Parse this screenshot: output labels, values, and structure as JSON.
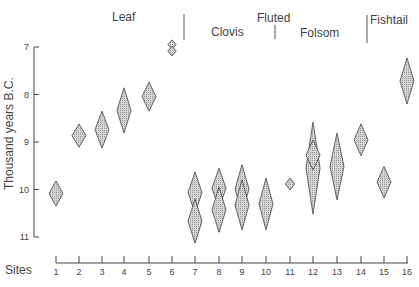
{
  "chart_data": {
    "type": "scatter",
    "subtype": "range-diamonds",
    "title": "",
    "xlabel": "Sites",
    "ylabel": "Thousand years B.C.",
    "ylim": [
      7,
      11
    ],
    "y_inverted": true,
    "y_ticks": [
      7,
      8,
      9,
      10,
      11
    ],
    "x_ticks": [
      1,
      2,
      3,
      4,
      5,
      6,
      7,
      8,
      9,
      10,
      11,
      12,
      13,
      14,
      15,
      16
    ],
    "grid": false,
    "groups": [
      {
        "name": "Leaf",
        "sites": [
          1,
          2,
          3,
          4,
          5,
          6
        ]
      },
      {
        "name": "Clovis",
        "sites": [
          7,
          8,
          9,
          10
        ]
      },
      {
        "name": "Fluted",
        "sites": []
      },
      {
        "name": "Folsom",
        "sites": [
          11,
          12,
          13,
          14
        ]
      },
      {
        "name": "Fishtail",
        "sites": [
          15,
          16
        ]
      }
    ],
    "points": [
      {
        "site": 1,
        "ranges": [
          [
            9.82,
            10.35
          ]
        ]
      },
      {
        "site": 2,
        "ranges": [
          [
            8.62,
            9.11
          ]
        ]
      },
      {
        "site": 3,
        "ranges": [
          [
            8.35,
            9.13
          ]
        ]
      },
      {
        "site": 4,
        "ranges": [
          [
            7.86,
            8.81
          ]
        ]
      },
      {
        "site": 5,
        "ranges": [
          [
            7.74,
            8.35
          ]
        ]
      },
      {
        "site": 6,
        "ranges": [
          [
            6.85,
            7.05
          ],
          [
            6.98,
            7.19
          ]
        ]
      },
      {
        "site": 7,
        "ranges": [
          [
            9.63,
            10.5
          ],
          [
            10.2,
            11.13
          ]
        ]
      },
      {
        "site": 8,
        "ranges": [
          [
            9.55,
            10.4
          ],
          [
            9.95,
            10.9
          ]
        ]
      },
      {
        "site": 9,
        "ranges": [
          [
            9.48,
            10.5
          ],
          [
            9.8,
            10.85
          ]
        ]
      },
      {
        "site": 10,
        "ranges": [
          [
            9.76,
            10.85
          ]
        ]
      },
      {
        "site": 11,
        "ranges": [
          [
            9.76,
            10.01
          ]
        ]
      },
      {
        "site": 12,
        "ranges": [
          [
            8.58,
            10.52
          ],
          [
            8.96,
            9.59
          ]
        ]
      },
      {
        "site": 13,
        "ranges": [
          [
            8.81,
            10.22
          ]
        ]
      },
      {
        "site": 14,
        "ranges": [
          [
            8.62,
            9.29
          ]
        ]
      },
      {
        "site": 15,
        "ranges": [
          [
            9.51,
            10.18
          ]
        ]
      },
      {
        "site": 16,
        "ranges": [
          [
            7.23,
            8.2
          ]
        ]
      }
    ]
  },
  "labels": {
    "ylabel": "Thousand years B.C.",
    "xlabel": "Sites",
    "group_leaf": "Leaf",
    "group_clovis": "Clovis",
    "group_fluted": "Fluted",
    "group_folsom": "Folsom",
    "group_fishtail": "Fishtail"
  },
  "colors": {
    "diamond_fill": "#c9c9c9",
    "diamond_stroke": "#555555",
    "axis": "#444444"
  }
}
